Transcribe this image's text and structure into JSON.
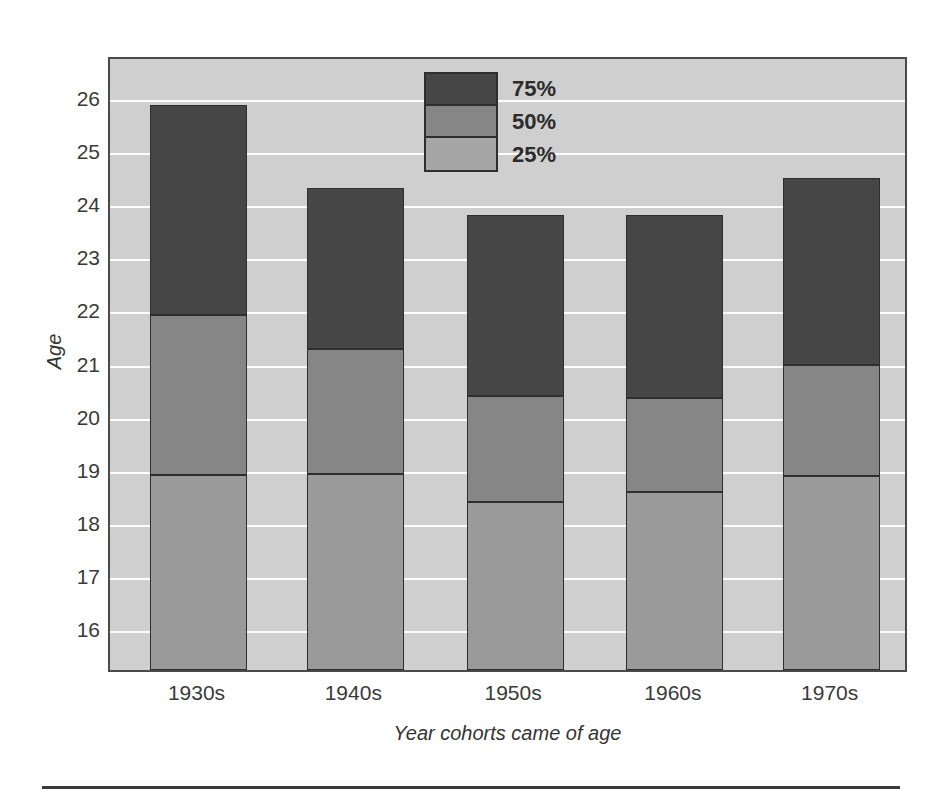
{
  "chart_data": {
    "type": "bar",
    "subtype": "stacked-quartile-bar",
    "title": "",
    "xlabel": "Year cohorts came of age",
    "ylabel": "Age",
    "categories": [
      "1930s",
      "1940s",
      "1950s",
      "1960s",
      "1970s"
    ],
    "ylim": [
      15.2,
      26.8
    ],
    "yticks": [
      16,
      17,
      18,
      19,
      20,
      21,
      22,
      23,
      24,
      25,
      26
    ],
    "ytick_labels": [
      "16",
      "17",
      "18",
      "19",
      "20",
      "21",
      "22",
      "23",
      "24",
      "25",
      "26"
    ],
    "grid": true,
    "grid_color": "#fdfdfd",
    "plot_background": "#cfcfcf",
    "legend": {
      "position": "top-center",
      "entries": [
        {
          "label": "75%",
          "color": "#464646"
        },
        {
          "label": "50%",
          "color": "#868686"
        },
        {
          "label": "25%",
          "color": "#a6a6a6"
        }
      ]
    },
    "series": [
      {
        "name": "25%",
        "color": "#9a9a9a",
        "values": [
          18.87,
          18.9,
          18.37,
          18.55,
          18.85
        ]
      },
      {
        "name": "50%",
        "color": "#868686",
        "values": [
          21.9,
          21.25,
          20.37,
          20.33,
          20.95
        ]
      },
      {
        "name": "75%",
        "color": "#464646",
        "values": [
          25.85,
          24.3,
          23.78,
          23.78,
          24.48
        ]
      }
    ],
    "bars": [
      {
        "category": "1930s",
        "p25": 18.87,
        "p50": 21.9,
        "p75": 25.85
      },
      {
        "category": "1940s",
        "p25": 18.9,
        "p50": 21.25,
        "p75": 24.3
      },
      {
        "category": "1950s",
        "p25": 18.37,
        "p50": 20.37,
        "p75": 23.78
      },
      {
        "category": "1960s",
        "p25": 18.55,
        "p50": 20.33,
        "p75": 23.78
      },
      {
        "category": "1970s",
        "p25": 18.85,
        "p50": 20.95,
        "p75": 24.48
      }
    ]
  },
  "colors": {
    "dark": "#464646",
    "medium": "#868686",
    "light": "#9a9a9a",
    "background": "#cfcfcf",
    "gridline": "#fdfdfd",
    "outline": "#2e2e2e",
    "text": "#343434"
  }
}
